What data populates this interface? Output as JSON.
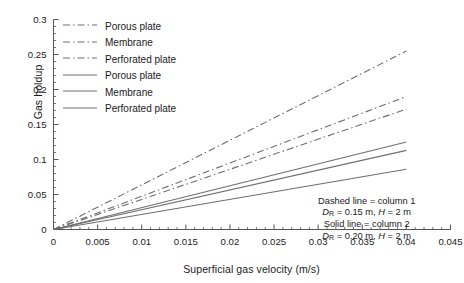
{
  "chart_data": {
    "type": "line",
    "title": "",
    "xlabel": "Superficial gas velocity (m/s)",
    "ylabel": "Gas holdup",
    "xlim": [
      0,
      0.045
    ],
    "ylim": [
      0,
      0.3
    ],
    "xticks": [
      "0",
      "0.005",
      "0.01",
      "0.015",
      "0.02",
      "0.025",
      "0.03",
      "0.035",
      "0.04",
      "0.045"
    ],
    "xtick_values": [
      0,
      0.005,
      0.01,
      0.015,
      0.02,
      0.025,
      0.03,
      0.035,
      0.04,
      0.045
    ],
    "yticks": [
      "0",
      "0.05",
      "0.1",
      "0.15",
      "0.2",
      "0.25",
      "0.3"
    ],
    "ytick_values": [
      0,
      0.05,
      0.1,
      0.15,
      0.2,
      0.25,
      0.3
    ],
    "grid": false,
    "legend_position": "upper-left",
    "x": [
      0,
      0.04
    ],
    "series": [
      {
        "name": "Porous plate",
        "style": "dashdot",
        "column": 1,
        "values": [
          0,
          0.255
        ],
        "color": "#6e6e6e"
      },
      {
        "name": "Membrane",
        "style": "dashdot",
        "column": 1,
        "values": [
          0,
          0.19
        ],
        "color": "#6e6e6e"
      },
      {
        "name": "Perforated plate",
        "style": "dashdot",
        "column": 1,
        "values": [
          0,
          0.172
        ],
        "color": "#6e6e6e"
      },
      {
        "name": "Porous plate",
        "style": "solid",
        "column": 2,
        "values": [
          0,
          0.125
        ],
        "color": "#6e6e6e"
      },
      {
        "name": "Membrane",
        "style": "solid",
        "column": 2,
        "values": [
          0,
          0.113
        ],
        "color": "#6e6e6e"
      },
      {
        "name": "Perforated plate",
        "style": "solid",
        "column": 2,
        "values": [
          0,
          0.086
        ],
        "color": "#6e6e6e"
      }
    ],
    "annotations": [
      {
        "line": "Dashed line = column 1"
      },
      {
        "line": "D_R = 0.15 m, H = 2 m"
      },
      {
        "line": "Solid line = column 2"
      },
      {
        "line": "D_R = 0.20 m, H = 2 m"
      }
    ]
  },
  "legend": {
    "items": [
      {
        "label": "Porous plate",
        "style": "dashdot"
      },
      {
        "label": "Membrane",
        "style": "dashdot"
      },
      {
        "label": "Perforated plate",
        "style": "dashdot"
      },
      {
        "label": "Porous plate",
        "style": "solid"
      },
      {
        "label": "Membrane",
        "style": "solid"
      },
      {
        "label": "Perforated plate",
        "style": "solid"
      }
    ]
  },
  "annotation": {
    "dashed_head": "Dashed line = column 1",
    "dashed_detail_pre": "D",
    "dashed_detail_sub": "R",
    "dashed_detail_post": " = 0.15 m, ",
    "dashed_detail_h": "H",
    "dashed_detail_hval": " = 2 m",
    "solid_head": "Solid line = column 2",
    "solid_detail_pre": "D",
    "solid_detail_sub": "R",
    "solid_detail_post": " = 0.20 m, ",
    "solid_detail_h": "H",
    "solid_detail_hval": " = 2 m"
  },
  "axes": {
    "x_title": "Superficial gas velocity (m/s)",
    "y_title": "Gas holdup"
  },
  "colors": {
    "line": "#6e6e6e",
    "axis": "#555555",
    "text": "#1a1a1a"
  }
}
